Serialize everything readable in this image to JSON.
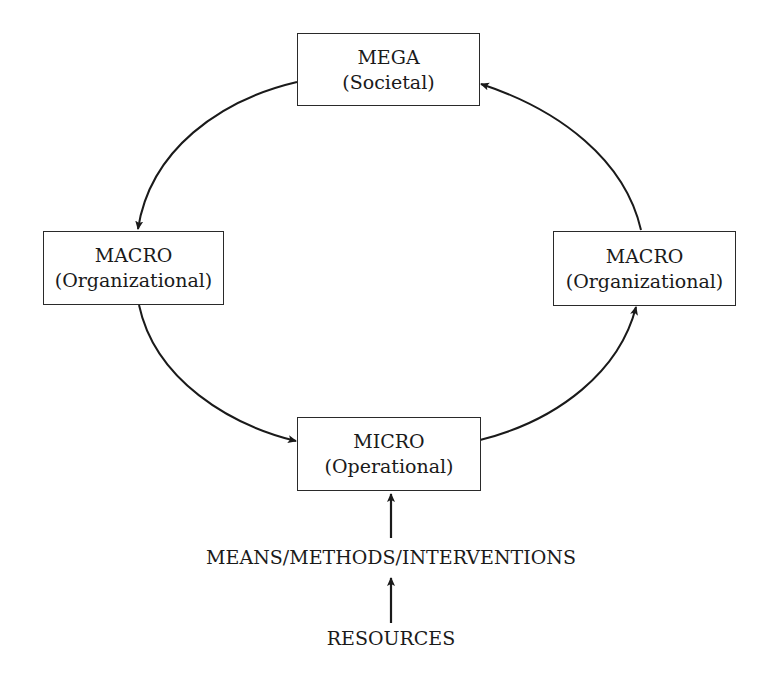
{
  "diagram": {
    "nodes": [
      {
        "id": "mega",
        "title": "MEGA",
        "subtitle": "(Societal)"
      },
      {
        "id": "macro_left",
        "title": "MACRO",
        "subtitle": "(Organizational)"
      },
      {
        "id": "macro_right",
        "title": "MACRO",
        "subtitle": "(Organizational)"
      },
      {
        "id": "micro",
        "title": "MICRO",
        "subtitle": "(Operational)"
      }
    ],
    "inputs": {
      "means": "MEANS/METHODS/INTERVENTIONS",
      "resources": "RESOURCES"
    },
    "edges": [
      {
        "from": "mega",
        "to": "macro_left"
      },
      {
        "from": "macro_left",
        "to": "micro"
      },
      {
        "from": "micro",
        "to": "macro_right"
      },
      {
        "from": "macro_right",
        "to": "mega"
      },
      {
        "from": "means",
        "to": "micro"
      },
      {
        "from": "resources",
        "to": "means"
      }
    ],
    "colors": {
      "stroke": "#2a2a2a",
      "background": "#ffffff"
    }
  }
}
